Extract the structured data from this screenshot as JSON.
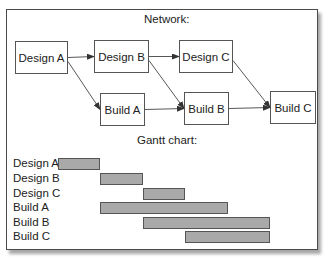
{
  "network": {
    "title": "Network:",
    "nodes": [
      {
        "id": "design_a",
        "label": "Design A",
        "x": 15,
        "y": 41,
        "w": 53,
        "h": 33
      },
      {
        "id": "design_b",
        "label": "Design B",
        "x": 94,
        "y": 40,
        "w": 55,
        "h": 33
      },
      {
        "id": "design_c",
        "label": "Design C",
        "x": 179,
        "y": 40,
        "w": 54,
        "h": 33
      },
      {
        "id": "build_a",
        "label": "Build A",
        "x": 100,
        "y": 93,
        "w": 45,
        "h": 33
      },
      {
        "id": "build_b",
        "label": "Build B",
        "x": 184,
        "y": 92,
        "w": 45,
        "h": 33
      },
      {
        "id": "build_c",
        "label": "Build C",
        "x": 270,
        "y": 91,
        "w": 46,
        "h": 33
      }
    ],
    "edges": [
      {
        "from": "design_a",
        "to": "design_b"
      },
      {
        "from": "design_a",
        "to": "build_a"
      },
      {
        "from": "design_b",
        "to": "design_c"
      },
      {
        "from": "design_b",
        "to": "build_b"
      },
      {
        "from": "build_a",
        "to": "build_b"
      },
      {
        "from": "design_c",
        "to": "build_c"
      },
      {
        "from": "build_b",
        "to": "build_c"
      }
    ]
  },
  "gantt": {
    "title": "Gantt chart:",
    "unit_px": 42.4,
    "origin_x": 58,
    "tasks": [
      {
        "label": "Design A",
        "start": 0,
        "end": 1
      },
      {
        "label": "Design B",
        "start": 1,
        "end": 2
      },
      {
        "label": "Design C",
        "start": 2,
        "end": 3
      },
      {
        "label": "Build A",
        "start": 1,
        "end": 4
      },
      {
        "label": "Build B",
        "start": 2,
        "end": 5
      },
      {
        "label": "Build C",
        "start": 3,
        "end": 5
      }
    ]
  },
  "colors": {
    "bar_fill": "#a9a9a9",
    "border": "#555555",
    "frame": "#4a4a4a"
  }
}
